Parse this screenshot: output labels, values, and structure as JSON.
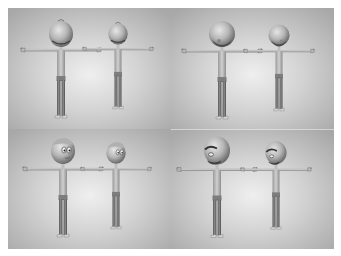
{
  "figure": {
    "background_color": "#ffffff",
    "panel_gradient": {
      "center": "#ececec",
      "mid": "#cfcfcf",
      "edge": "#a9a9a9"
    },
    "skin_color": "#c9c9c9",
    "panels": [
      {
        "id": "top-left",
        "pose": "heads-tilted-up",
        "label": "head-up-view"
      },
      {
        "id": "top-right",
        "pose": "heads-tilted-down",
        "label": "head-down-view"
      },
      {
        "id": "bottom-left",
        "pose": "heads-front-facing-eyes",
        "label": "front-face-view"
      },
      {
        "id": "bottom-right",
        "pose": "heads-angry-brow",
        "label": "angry-face-view"
      }
    ],
    "characters": [
      {
        "name": "large-character",
        "scale": 1.0
      },
      {
        "name": "small-character",
        "scale": 0.88
      }
    ]
  }
}
